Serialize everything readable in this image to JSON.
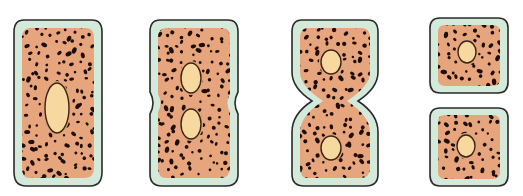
{
  "figure": {
    "width": 523,
    "height": 196
  },
  "colors": {
    "background": "#ffffff",
    "wall": "#d3eadb",
    "outline": "#2b2b2b",
    "cytoplasm": "#e6a57c",
    "granule": "#1e0f0b",
    "nucleus_fill": "#f7d9a0",
    "nucleus_outline": "#3a2414"
  },
  "stages": [
    {
      "name": "elongated-cell",
      "outer": "M24,20 L92,20 Q102,20 102,32 L102,172 Q102,186 90,186 L26,186 Q14,186 14,172 L14,32 Q14,20 24,20 Z",
      "inner": "M30,28 L86,28 Q94,28 94,38 L94,168 Q94,178 84,178 L30,178 Q22,178 22,168 L22,38 Q22,28 30,28 Z",
      "clip": {
        "x": 14,
        "y": 20,
        "w": 88,
        "h": 166
      },
      "nuclei": [
        {
          "cx": 57,
          "cy": 108,
          "rx": 12,
          "ry": 25
        }
      ]
    },
    {
      "name": "dividing-cell-early",
      "outer": "M160,20 L228,20 Q238,20 238,32 L238,92 Q232,103 238,114 L238,174 Q238,186 226,186 L162,186 Q150,186 150,174 L150,114 Q156,103 150,92 L150,32 Q150,20 160,20 Z",
      "inner": "M166,28 L222,28 Q230,28 230,38 L230,94 Q225,103 230,112 L230,168 Q230,178 220,178 L166,178 Q158,178 158,168 L158,112 Q163,103 158,94 L158,38 Q158,28 166,28 Z",
      "clip": {
        "x": 150,
        "y": 20,
        "w": 88,
        "h": 166
      },
      "nuclei": [
        {
          "cx": 191,
          "cy": 78,
          "rx": 10,
          "ry": 15
        },
        {
          "cx": 191,
          "cy": 124,
          "rx": 10,
          "ry": 15
        }
      ]
    },
    {
      "name": "dividing-cell-late",
      "outer": "M302,20 L368,20 Q378,20 378,32 L378,72 Q378,88 358,101 Q378,114 378,132 L378,174 Q378,186 366,186 L304,186 Q292,186 292,174 L292,132 Q292,114 312,101 Q292,88 292,72 L292,32 Q292,20 302,20 Z",
      "inner": "M308,28 L362,28 Q370,28 370,38 L370,72 Q370,86 347,101 Q370,116 370,132 L370,168 Q370,178 360,178 L308,178 Q300,178 300,168 L300,132 Q300,116 323,101 Q300,86 300,72 L300,38 Q300,28 308,28 Z",
      "clip": {
        "x": 292,
        "y": 20,
        "w": 86,
        "h": 166
      },
      "nuclei": [
        {
          "cx": 331,
          "cy": 62,
          "rx": 10,
          "ry": 12
        },
        {
          "cx": 331,
          "cy": 148,
          "rx": 10,
          "ry": 12
        }
      ]
    },
    {
      "name": "daughter-cell-top",
      "outer": "M440,18 L498,18 Q508,18 508,28 L508,82 Q508,93 498,93 L440,93 Q430,93 430,82 L430,28 Q430,18 440,18 Z",
      "inner": "M445,25 L493,25 Q500,25 500,32 L500,79 Q500,86 493,86 L445,86 Q438,86 438,79 L438,32 Q438,25 445,25 Z",
      "clip": {
        "x": 430,
        "y": 18,
        "w": 78,
        "h": 75
      },
      "nuclei": [
        {
          "cx": 467,
          "cy": 52,
          "rx": 9,
          "ry": 11
        }
      ]
    },
    {
      "name": "daughter-cell-bottom",
      "outer": "M440,108 L498,108 Q508,108 508,118 L508,175 Q508,186 498,186 L440,186 Q430,186 430,175 L430,118 Q430,108 440,108 Z",
      "inner": "M445,115 L493,115 Q500,115 500,122 L500,172 Q500,179 493,179 L445,179 Q438,179 438,172 L438,122 Q438,115 445,115 Z",
      "clip": {
        "x": 430,
        "y": 108,
        "w": 78,
        "h": 78
      },
      "nuclei": [
        {
          "cx": 466,
          "cy": 146,
          "rx": 9,
          "ry": 11
        }
      ]
    }
  ],
  "granules": {
    "spacing": 9,
    "seed": 7,
    "radius_min": 1.2,
    "radius_max": 2.2
  }
}
